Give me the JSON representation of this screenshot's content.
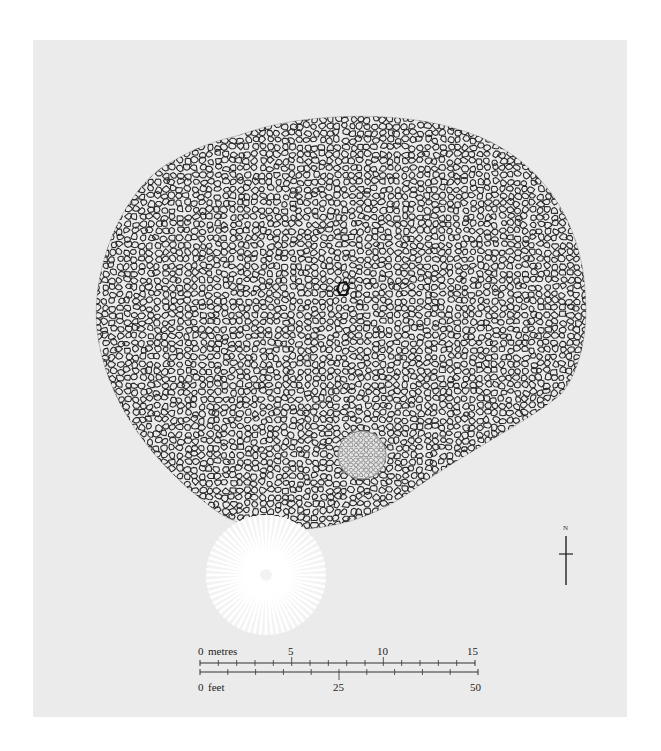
{
  "figure": {
    "type": "site plan",
    "colors": {
      "background": "#ffffff",
      "panel": "#ebebeb",
      "stone_outline": "#2a2a2a",
      "cairn_outline": "#8a8a8a",
      "burnt_area": "#ffffff"
    }
  },
  "features": {
    "central_stone": {
      "label": "central stone",
      "x": 343,
      "y": 289
    },
    "small_cairn": {
      "label": "small cairn",
      "x": 362,
      "y": 455,
      "r": 24
    },
    "disturbed_area": {
      "label": "radiating disturbed area",
      "x": 266,
      "y": 575,
      "r": 60
    }
  },
  "north_arrow": {
    "label": "N"
  },
  "scale": {
    "metres": {
      "unit_label": "metres",
      "ticks": [
        "0",
        "5",
        "10",
        "15"
      ]
    },
    "feet": {
      "unit_label": "feet",
      "ticks": [
        "0",
        "25",
        "50"
      ]
    }
  }
}
